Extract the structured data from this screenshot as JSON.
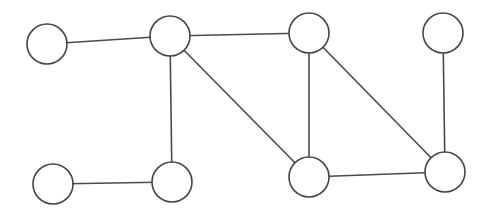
{
  "diagram": {
    "type": "undirected-graph",
    "colors": {
      "stroke": "#444444",
      "fill": "#ffffff",
      "background": "#ffffff"
    },
    "nodes": [
      {
        "id": "A",
        "cx": 47,
        "cy": 44,
        "r": 20
      },
      {
        "id": "B",
        "cx": 170,
        "cy": 36,
        "r": 20
      },
      {
        "id": "C",
        "cx": 309,
        "cy": 33,
        "r": 20
      },
      {
        "id": "D",
        "cx": 443,
        "cy": 33,
        "r": 20
      },
      {
        "id": "E",
        "cx": 53,
        "cy": 184,
        "r": 20
      },
      {
        "id": "F",
        "cx": 172,
        "cy": 182,
        "r": 20
      },
      {
        "id": "G",
        "cx": 309,
        "cy": 177,
        "r": 20
      },
      {
        "id": "H",
        "cx": 445,
        "cy": 172,
        "r": 20
      }
    ],
    "edges": [
      {
        "from": "A",
        "to": "B"
      },
      {
        "from": "B",
        "to": "C"
      },
      {
        "from": "B",
        "to": "F"
      },
      {
        "from": "B",
        "to": "G"
      },
      {
        "from": "C",
        "to": "G"
      },
      {
        "from": "C",
        "to": "H"
      },
      {
        "from": "D",
        "to": "H"
      },
      {
        "from": "E",
        "to": "F"
      },
      {
        "from": "G",
        "to": "H"
      }
    ]
  }
}
